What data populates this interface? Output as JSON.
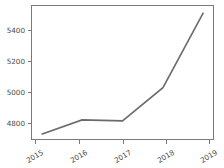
{
  "chart_data": {
    "type": "line",
    "title": "",
    "xlabel": "",
    "ylabel": "",
    "categories": [
      "2015",
      "2016",
      "2017",
      "2018",
      "2019"
    ],
    "values": [
      4745,
      4836,
      4830,
      5040,
      5515
    ],
    "series": [
      {
        "name": "series-1",
        "values": [
          4745,
          4836,
          4830,
          5040,
          5515
        ],
        "color": "#6b6b6b"
      }
    ],
    "x": [
      2015,
      2016,
      2017,
      2018,
      2019
    ],
    "ylim": [
      4712,
      5560
    ],
    "xlim": [
      2014.75,
      2019.25
    ],
    "yticks": [
      4800,
      5000,
      5200,
      5400
    ],
    "ytick_labels": [
      "4800",
      "5000",
      "5200",
      "5400"
    ],
    "xticks": [
      2015,
      2016,
      2017,
      2018,
      2019
    ],
    "xtick_labels": [
      "2015",
      "2016",
      "2017",
      "2018",
      "2019"
    ],
    "xtick_rotation": -30,
    "grid": false,
    "legend": false,
    "legend_position": "none",
    "frame": true,
    "line_color": "#6b6b6b",
    "axis_color": "#7a7a7a",
    "background": "#ffffff"
  }
}
